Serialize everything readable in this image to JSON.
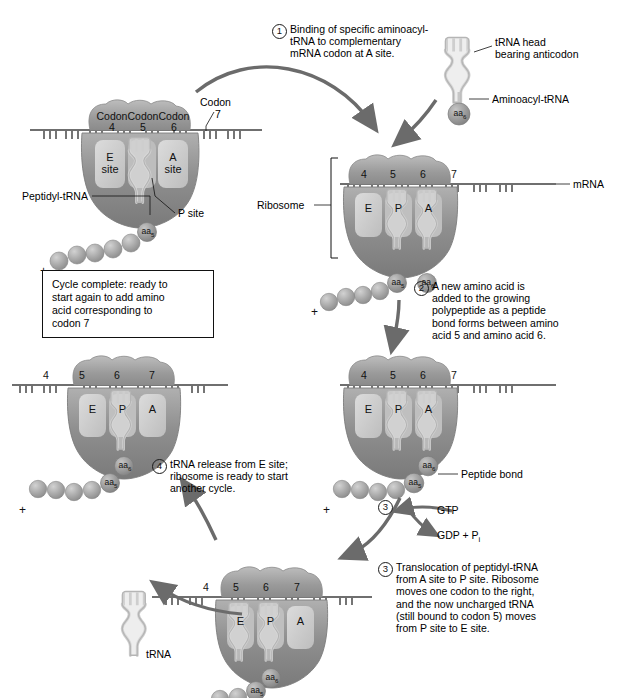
{
  "figure": {
    "colors": {
      "small_subunit": "#9b9b9b",
      "large_subunit": "#8c8c8c",
      "site_pocket": "#c9c9c9",
      "trna": "#d8d8d8",
      "trna_outline": "#9d9d9d",
      "amino_acid": "#a5a5a5",
      "mrna": "#6f6f6f",
      "arrow": "#6b6b6b",
      "text": "#000000"
    }
  },
  "steps": [
    {
      "number": "1",
      "text": "Binding of specific aminoacyl-\ntRNA to complementary\nmRNA codon at A site."
    },
    {
      "number": "2",
      "text": "A new amino acid is\nadded to the growing\npolypeptide as a peptide\nbond forms between amino\nacid 5 and amino acid 6."
    },
    {
      "number": "3",
      "text": "Translocation of peptidyl-tRNA\nfrom A site to P site. Ribosome\nmoves one codon to the right,\nand the now uncharged tRNA\n(still bound to codon 5) moves\nfrom P site to E site."
    },
    {
      "number": "4",
      "text": "tRNA release from E site;\nribosome is ready to start\nanother cycle."
    }
  ],
  "callouts": {
    "trna_head": "tRNA head\nbearing anticodon",
    "aminoacyl_trna": "Aminoacyl-tRNA",
    "codon_label": "Codon",
    "codon_number": "7",
    "peptidyl_trna": "Peptidyl-tRNA",
    "p_site": "P site",
    "ribosome": "Ribosome",
    "mrna": "mRNA",
    "peptide_bond": "Peptide bond",
    "trna_released": "tRNA",
    "gtp": "GTP",
    "gdp_pi": "GDP + P",
    "gdp_pi_sub": "i",
    "step3_marker": "3"
  },
  "cycle_note": {
    "text": "Cycle complete: ready to\nstart again to add amino\nacid corresponding to\ncodon 7"
  },
  "ribosomes": [
    {
      "id": "ribosome-top-left",
      "codon_word_labels": [
        "Codon",
        "Codon",
        "Codon"
      ],
      "codon_numbers": [
        "4",
        "5",
        "6"
      ],
      "sites": [
        "E",
        "A"
      ],
      "site_sublabels": [
        "site",
        "site"
      ],
      "p_site_occupied": true,
      "amino_acids": [
        "aa5"
      ],
      "amino_acid_subs": [
        "5"
      ],
      "chain_plus": "+"
    },
    {
      "id": "ribosome-step1-right",
      "codon_numbers": [
        "4",
        "5",
        "6",
        "7"
      ],
      "sites": [
        "E",
        "P",
        "A"
      ],
      "amino_acids": [
        "aa5",
        "aa6"
      ],
      "amino_acid_subs": [
        "5",
        "6"
      ],
      "chain_plus": "+"
    },
    {
      "id": "ribosome-step2-right",
      "codon_numbers": [
        "4",
        "5",
        "6",
        "7"
      ],
      "sites": [
        "E",
        "P",
        "A"
      ],
      "amino_acids": [
        "aa6",
        "aa5"
      ],
      "amino_acid_subs": [
        "6",
        "5"
      ],
      "chain_plus": "+"
    },
    {
      "id": "ribosome-step3-bottom",
      "codon_numbers": [
        "4",
        "5",
        "6",
        "7"
      ],
      "sites": [
        "E",
        "P",
        "A"
      ],
      "amino_acids": [
        "aa6",
        "aa5"
      ],
      "amino_acid_subs": [
        "6",
        "5"
      ],
      "chain_plus": "+"
    },
    {
      "id": "ribosome-step4-left",
      "codon_numbers": [
        "4",
        "5",
        "6",
        "7"
      ],
      "sites": [
        "E",
        "P",
        "A"
      ],
      "amino_acids": [
        "aa6",
        "aa5"
      ],
      "amino_acid_subs": [
        "6",
        "5"
      ],
      "chain_plus": "+"
    }
  ],
  "free_trna": {
    "label": "tRNA"
  },
  "top_trna": {
    "amino_acid": "aa6",
    "amino_acid_sub": "6"
  }
}
